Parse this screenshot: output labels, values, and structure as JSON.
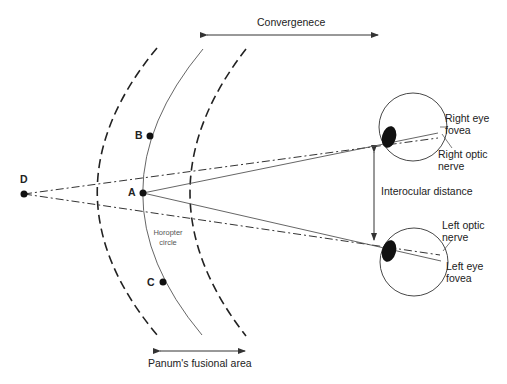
{
  "diagram": {
    "labels": {
      "convergence": "Convergenece",
      "panum": "Panum's fusional area",
      "interocular": "Interocular distance",
      "horopter_line1": "Horopter",
      "horopter_line2": "circle",
      "right_fovea_1": "Right eye",
      "right_fovea_2": "fovea",
      "right_nerve_1": "Right optic",
      "right_nerve_2": "nerve",
      "left_nerve_1": "Left optic",
      "left_nerve_2": "nerve",
      "left_fovea_1": "Left eye",
      "left_fovea_2": "fovea"
    },
    "points": {
      "A": "A",
      "B": "B",
      "C": "C",
      "D": "D"
    },
    "colors": {
      "line": "#444444",
      "text": "#222222",
      "lens": "#111111"
    }
  }
}
